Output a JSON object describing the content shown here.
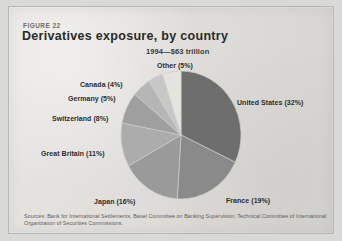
{
  "figure": {
    "label": "FIGURE 22",
    "title": "Derivatives exposure, by country",
    "subtitle": "1994—$63 trillion",
    "source": "Sources: Bank for International Settlements, Basel Committee on Banking Supervision; Technical Committee of International Organization of Securities Commissions."
  },
  "chart_data": {
    "type": "pie",
    "title": "Derivatives exposure, by country",
    "subtitle": "1994—$63 trillion",
    "unit": "percent of total",
    "total_label": "$63 trillion",
    "year": "1994",
    "legend_position": "callout-labels",
    "categories": [
      "United States",
      "France",
      "Japan",
      "Great Britain",
      "Switzerland",
      "Germany",
      "Canada",
      "Other"
    ],
    "values": [
      32,
      19,
      16,
      11,
      8,
      5,
      4,
      5
    ],
    "labels": [
      "United States (32%)",
      "France (19%)",
      "Japan (16%)",
      "Great Britain (11%)",
      "Switzerland (8%)",
      "Germany (5%)",
      "Canada (4%)",
      "Other (5%)"
    ],
    "colors": [
      "#6e6e6e",
      "#8a8a8a",
      "#9a9a9a",
      "#acacac",
      "#9f9f9f",
      "#b6b6b6",
      "#c7c7c7",
      "#e4e3e0"
    ]
  },
  "slices": {
    "united_states": "United States (32%)",
    "france": "France (19%)",
    "japan": "Japan (16%)",
    "great_britain": "Great Britain (11%)",
    "switzerland": "Switzerland (8%)",
    "germany": "Germany (5%)",
    "canada": "Canada (4%)",
    "other": "Other (5%)"
  }
}
